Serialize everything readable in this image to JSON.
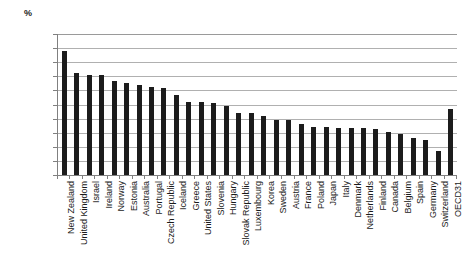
{
  "chart_data": {
    "type": "bar",
    "title": "",
    "subtitle": "",
    "unit_label": "%",
    "xlabel": "",
    "ylabel": "",
    "ylim": [
      0,
      100
    ],
    "ytick_step": 10,
    "grid": true,
    "legend": "none",
    "bar_color": "#1c1c1c",
    "ytick_labels": [
      "100.0",
      "90.0",
      "80.0",
      "70.0",
      "60.0",
      "50.0",
      "40.0",
      "30.0",
      "20.0",
      "10.0",
      "0.0"
    ],
    "categories": [
      "New Zealand",
      "United Kingdom",
      "Israel",
      "Ireland",
      "Norway",
      "Estonia",
      "Australia",
      "Portugal",
      "Czech Republic",
      "Iceland",
      "Greece",
      "United States",
      "Slovenia",
      "Hungary",
      "Slovak Republic",
      "Luxembourg",
      "Korea",
      "Sweden",
      "Austria",
      "France",
      "Poland",
      "Japan",
      "Italy",
      "Denmark",
      "Netherlands",
      "Finland",
      "Canada",
      "Belgium",
      "Spain",
      "Germany",
      "Switzerland",
      "OECD31"
    ],
    "values": [
      88.0,
      72.0,
      71.0,
      71.0,
      67.0,
      65.5,
      64.0,
      62.5,
      62.0,
      56.5,
      52.0,
      51.5,
      51.0,
      49.0,
      44.0,
      44.0,
      42.0,
      39.0,
      39.0,
      36.0,
      34.0,
      34.0,
      33.5,
      33.0,
      33.0,
      32.5,
      30.5,
      29.0,
      26.0,
      25.0,
      17.0,
      47.0
    ]
  }
}
